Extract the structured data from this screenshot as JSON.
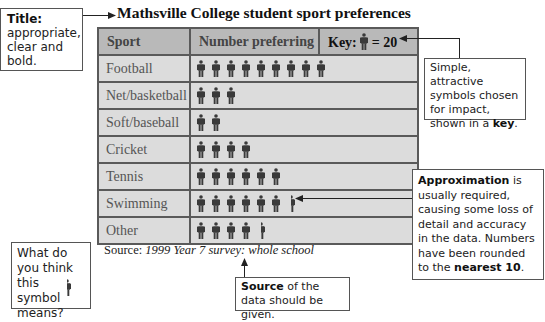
{
  "title": "Mathsville College student sport preferences",
  "table": {
    "headers": {
      "sport": "Sport",
      "number": "Number preferring",
      "key_label": "Key:",
      "key_value": "= 20"
    },
    "rows": [
      {
        "sport": "Football",
        "symbols": 9
      },
      {
        "sport": "Net/basketball",
        "symbols": 3
      },
      {
        "sport": "Soft/baseball",
        "symbols": 2
      },
      {
        "sport": "Cricket",
        "symbols": 4
      },
      {
        "sport": "Tennis",
        "symbols": 6
      },
      {
        "sport": "Swimming",
        "symbols": 6.5
      },
      {
        "sport": "Other",
        "symbols": 4.5
      }
    ]
  },
  "source": {
    "label": "Source:",
    "text": "1999 Year 7 survey: whole school"
  },
  "callouts": {
    "title": {
      "bold": "Title:",
      "text": "appropriate, clear and bold."
    },
    "key": {
      "text": "Simple, attractive symbols chosen for impact, shown in a",
      "bold": "key",
      "end": "."
    },
    "approx": {
      "bold": "Approximation",
      "text": "is usually required, causing some loss of detail and accuracy in the data. Numbers have been rounded to the",
      "bold2": "nearest 10",
      "end": "."
    },
    "source": {
      "bold": "Source",
      "text": "of the data should be given."
    },
    "question": {
      "text": "What do you think this symbol means?"
    }
  },
  "colors": {
    "header_bg": "#b9b9b9",
    "cell_bg": "#dcdcdc",
    "border": "#5a5a5a",
    "figure": "#3a3a3a"
  },
  "chart_data": {
    "type": "table",
    "title": "Mathsville College student sport preferences",
    "key": "1 symbol = 20 students",
    "categories": [
      "Football",
      "Net/basketball",
      "Soft/baseball",
      "Cricket",
      "Tennis",
      "Swimming",
      "Other"
    ],
    "symbols": [
      9,
      3,
      2,
      4,
      6,
      6.5,
      4.5
    ],
    "values": [
      180,
      60,
      40,
      80,
      120,
      130,
      90
    ],
    "xlabel": "Number preferring",
    "ylabel": "Sport",
    "source": "1999 Year 7 survey: whole school"
  }
}
